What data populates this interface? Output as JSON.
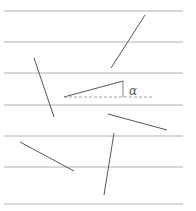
{
  "diagram": {
    "angle_label": "α",
    "colors": {
      "line": "#b0b0b0",
      "needle": "#555555",
      "dashed": "#888888"
    },
    "parallel_lines_y": [
      11,
      42,
      73,
      105,
      136,
      167,
      204
    ],
    "needles": [
      {
        "x1": 145,
        "y1": 15,
        "x2": 111,
        "y2": 68
      },
      {
        "x1": 34,
        "y1": 58,
        "x2": 54,
        "y2": 117
      },
      {
        "x1": 64,
        "y1": 97,
        "x2": 123,
        "y2": 81
      },
      {
        "x1": 108,
        "y1": 114,
        "x2": 167,
        "y2": 130
      },
      {
        "x1": 20,
        "y1": 142,
        "x2": 74,
        "y2": 171
      },
      {
        "x1": 114,
        "y1": 133,
        "x2": 104,
        "y2": 195
      }
    ],
    "reference_dashed": {
      "x1": 64,
      "y1": 97,
      "x2": 152,
      "y2": 97
    },
    "angle_tick": {
      "x1": 123,
      "y1": 81,
      "x2": 123,
      "y2": 97
    }
  }
}
